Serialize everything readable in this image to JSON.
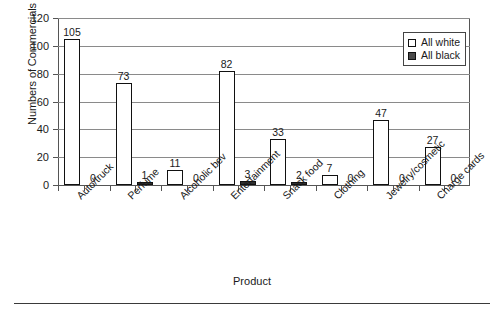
{
  "chart_data": {
    "type": "bar",
    "title": "",
    "xlabel": "Product",
    "ylabel": "Numbers of Commercials",
    "ylim": [
      0,
      120
    ],
    "yticks": [
      0,
      20,
      40,
      60,
      80,
      100,
      120
    ],
    "grid": "horizontal",
    "legend_position": "top-right",
    "categories": [
      "Auto/truck",
      "Perfume",
      "Alcoholic bev",
      "Entertainment",
      "Snack food",
      "Clothing",
      "Jewelry/cosmetic",
      "Charge cards"
    ],
    "series": [
      {
        "name": "All white",
        "color": "#ffffff",
        "values": [
          105,
          73,
          11,
          82,
          33,
          7,
          47,
          27
        ]
      },
      {
        "name": "All black",
        "color": "#2e2e2e",
        "values": [
          0,
          1,
          0,
          3,
          2,
          0,
          0,
          0
        ]
      }
    ]
  },
  "legend": {
    "entries": [
      {
        "label": "All white",
        "swatch": "white"
      },
      {
        "label": "All black",
        "swatch": "black"
      }
    ]
  }
}
